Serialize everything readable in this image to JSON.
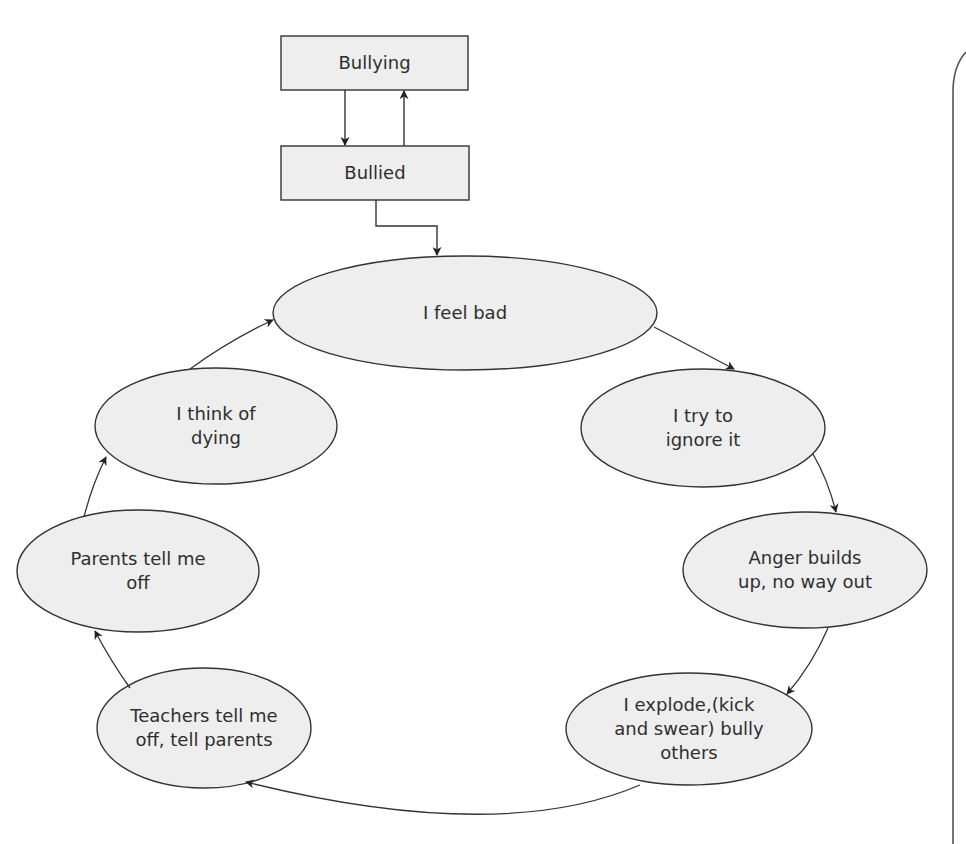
{
  "diagram": {
    "colors": {
      "node_fill": "#eeeeee",
      "stroke": "#333333",
      "text": "#2e2e2e",
      "background": "#ffffff"
    },
    "boxes": [
      {
        "id": "bullying",
        "label": "Bullying"
      },
      {
        "id": "bullied",
        "label": "Bullied"
      }
    ],
    "cycle": [
      {
        "id": "feel-bad",
        "label": "I feel bad"
      },
      {
        "id": "ignore",
        "label": "I try to\nignore it"
      },
      {
        "id": "anger",
        "label": "Anger builds\nup, no way out"
      },
      {
        "id": "explode",
        "label": "I explode,(kick\nand swear) bully\nothers"
      },
      {
        "id": "teachers",
        "label": "Teachers tell me\noff, tell parents"
      },
      {
        "id": "parents",
        "label": "Parents tell me\noff"
      },
      {
        "id": "dying",
        "label": "I think of\ndying"
      }
    ],
    "edges": [
      {
        "from": "Bullying",
        "to": "Bullied"
      },
      {
        "from": "Bullied",
        "to": "Bullying"
      },
      {
        "from": "Bullied",
        "to": "I feel bad"
      },
      {
        "from": "I feel bad",
        "to": "I try to ignore it"
      },
      {
        "from": "I try to ignore it",
        "to": "Anger builds up, no way out"
      },
      {
        "from": "Anger builds up, no way out",
        "to": "I explode,(kick and swear) bully others"
      },
      {
        "from": "I explode,(kick and swear) bully others",
        "to": "Teachers tell me off, tell parents"
      },
      {
        "from": "Teachers tell me off, tell parents",
        "to": "Parents tell me off"
      },
      {
        "from": "Parents tell me off",
        "to": "I think of dying"
      },
      {
        "from": "I think of dying",
        "to": "I feel bad"
      }
    ]
  }
}
